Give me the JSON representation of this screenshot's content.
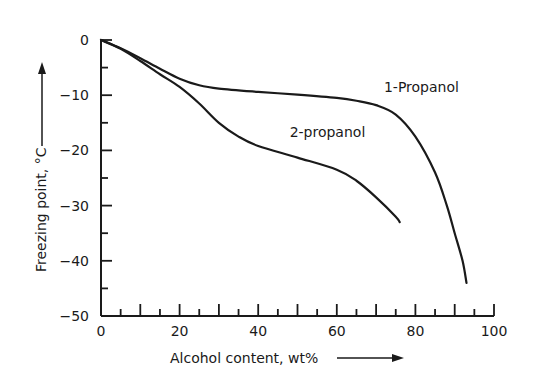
{
  "chart_data": {
    "type": "line",
    "title": "",
    "xlabel": "Alcohol content, wt%",
    "ylabel": "Freezing point, °C",
    "xlim": [
      0,
      100
    ],
    "ylim": [
      -50,
      0
    ],
    "x_ticks": [
      0,
      20,
      40,
      60,
      80,
      100
    ],
    "y_ticks": [
      0,
      -10,
      -20,
      -30,
      -40,
      -50
    ],
    "x_tick_labels": [
      "0",
      "20",
      "40",
      "60",
      "80",
      "100"
    ],
    "y_tick_labels": [
      "0",
      "-10",
      "-20",
      "-30",
      "-40",
      "-50"
    ],
    "grid": false,
    "legend": "inline labels",
    "series": [
      {
        "name": "1-Propanol",
        "x": [
          0,
          5,
          10,
          15,
          20,
          25,
          30,
          40,
          50,
          60,
          65,
          70,
          75,
          80,
          85,
          88,
          90,
          92,
          93
        ],
        "y": [
          0,
          -1.5,
          -3.3,
          -5.2,
          -7.0,
          -8.2,
          -8.8,
          -9.4,
          -9.9,
          -10.5,
          -11.0,
          -11.8,
          -13.5,
          -17.5,
          -24,
          -30,
          -35,
          -40,
          -44
        ]
      },
      {
        "name": "2-propanol",
        "x": [
          0,
          5,
          10,
          15,
          20,
          25,
          30,
          35,
          40,
          50,
          60,
          65,
          70,
          75,
          76
        ],
        "y": [
          0,
          -1.6,
          -3.8,
          -6.2,
          -8.5,
          -11.5,
          -15.0,
          -17.5,
          -19.2,
          -21.3,
          -23.5,
          -25.5,
          -28.5,
          -32.0,
          -33.0
        ]
      }
    ],
    "annotations": [
      {
        "text": "1-Propanol",
        "x": 72,
        "y": -9.5
      },
      {
        "text": "2-propanol",
        "x": 48,
        "y": -17.5
      }
    ]
  }
}
